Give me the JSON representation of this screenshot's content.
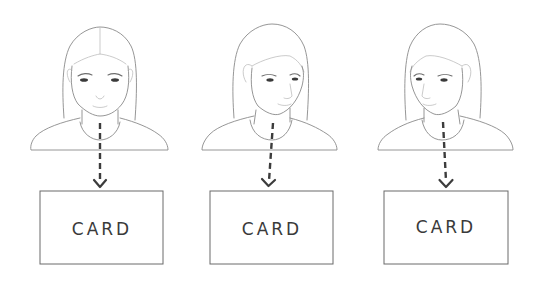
{
  "diagram": {
    "panels": [
      {
        "id": "front",
        "pose": "facing forward",
        "card_label": "CARD"
      },
      {
        "id": "turned-left",
        "pose": "head turned to viewer's right",
        "card_label": "CARD"
      },
      {
        "id": "turned-right",
        "pose": "head turned to viewer's left",
        "card_label": "CARD"
      }
    ],
    "colors": {
      "sketch_line": "#8a8a8a",
      "arrow": "#3c3c3c",
      "box_border": "#6a6a6a",
      "text": "#3a3a3a",
      "background": "#ffffff"
    }
  }
}
